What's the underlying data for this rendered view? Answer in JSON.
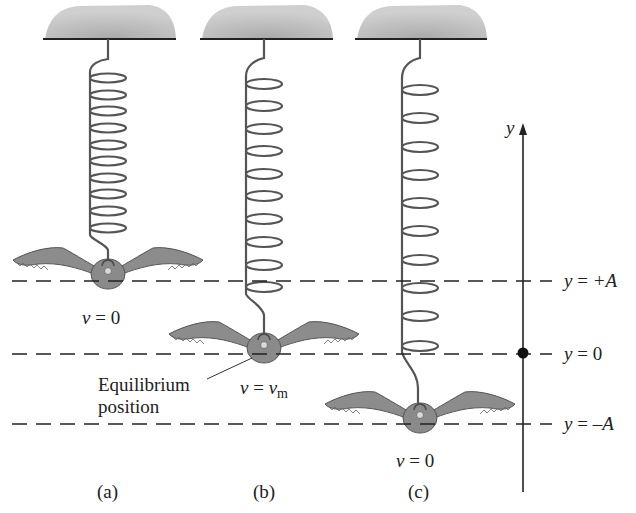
{
  "figure": {
    "panels": [
      {
        "id": "a",
        "caption": "(a)",
        "velocity_label": "v = 0",
        "v_sym": "v",
        "v_rhs": "0",
        "position": "y = +A"
      },
      {
        "id": "b",
        "caption": "(b)",
        "velocity_label": "v = v_m",
        "v_sym": "v",
        "v_rhs": "v",
        "v_rhs_sub": "m",
        "position": "y = 0"
      },
      {
        "id": "c",
        "caption": "(c)",
        "velocity_label": "v = 0",
        "v_sym": "v",
        "v_rhs": "0",
        "position": "y = -A"
      }
    ],
    "equilibrium_label_line1": "Equilibrium",
    "equilibrium_label_line2": "position",
    "axis": {
      "label": "y"
    },
    "reference_lines": [
      {
        "lhs": "y",
        "op": "=",
        "rhs": "+A"
      },
      {
        "lhs": "y",
        "op": "=",
        "rhs": "0"
      },
      {
        "lhs": "y",
        "op": "=",
        "rhs": "–A"
      }
    ],
    "colors": {
      "ceiling": "#b4b4b4",
      "bird": "#8a8a8a",
      "line": "#222222",
      "spring": "#555555"
    }
  }
}
